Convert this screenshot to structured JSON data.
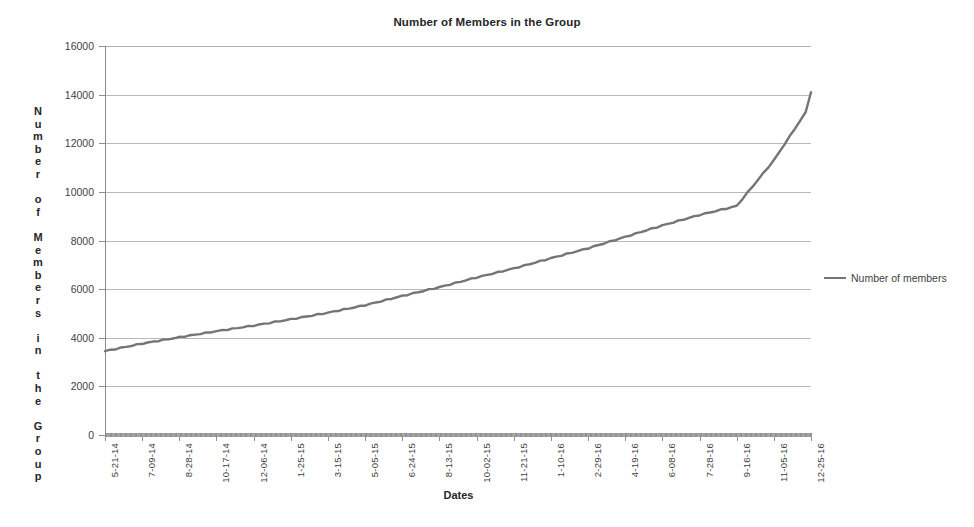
{
  "chart_data": {
    "type": "line",
    "title": "Number of Members in the Group",
    "xlabel": "Dates",
    "ylabel": "Number of Members in the Group",
    "ylim": [
      0,
      16000
    ],
    "ytick_step": 2000,
    "yticks": [
      "0",
      "2000",
      "4000",
      "6000",
      "8000",
      "10000",
      "12000",
      "14000",
      "16000"
    ],
    "grid": true,
    "legend_position": "right",
    "series_color": "#757575",
    "categories": [
      "5-21-14",
      "7-09-14",
      "8-28-14",
      "10-17-14",
      "12-06-14",
      "1-25-15",
      "3-15-15",
      "5-05-15",
      "6-24-15",
      "8-13-15",
      "10-02-15",
      "11-21-15",
      "1-10-16",
      "2-29-16",
      "4-19-16",
      "6-08-16",
      "7-28-16",
      "9-16-16",
      "11-05-16",
      "12-25-16"
    ],
    "series": [
      {
        "name": "Number of members",
        "values": [
          3450,
          3760,
          4020,
          4270,
          4500,
          4760,
          5030,
          5340,
          5720,
          6080,
          6480,
          6850,
          7270,
          7680,
          8150,
          8620,
          9050,
          9420,
          11300,
          13600
        ]
      }
    ],
    "annotations": {
      "start_value": 3450,
      "end_value": 14100,
      "inflection_category": "9-16-16",
      "inflection_value": 9420
    }
  },
  "legend": {
    "entries": [
      {
        "label": "Number of members",
        "color": "#757575"
      }
    ]
  }
}
